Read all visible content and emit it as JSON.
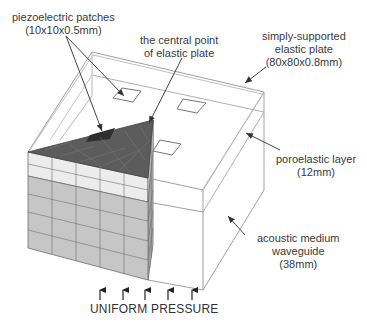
{
  "figure": {
    "type": "3D schematic of piezoelectric-patch plate over poroelastic layer and acoustic waveguide",
    "colors": {
      "outline": "#9a9a9a",
      "plate_mesh_top": "#5a5a5a",
      "patch_dark": "#333333",
      "poro_layer": "#ececec",
      "waveguide_mesh": "#c4c4c4",
      "mesh_lines": "#6e6e6e",
      "arrow": "#333333",
      "text": "#3a3a3a"
    }
  },
  "labels": {
    "patches": {
      "line1": "piezoelectric patches",
      "line2": "(10x10x0.5mm)"
    },
    "center": {
      "line1": "the central point",
      "line2": "of elastic plate"
    },
    "plate": {
      "line1": "simply-supported",
      "line2": "elastic plate",
      "line3": "(80x80x0.8mm)"
    },
    "poro": {
      "line1": "poroelastic layer",
      "line2": "(12mm)"
    },
    "waveguide": {
      "line1": "acoustic medium",
      "line2": "waveguide",
      "line3": "(38mm)"
    },
    "pressure": "UNIFORM PRESSURE"
  },
  "pressure_arrows": {
    "count": 5
  }
}
